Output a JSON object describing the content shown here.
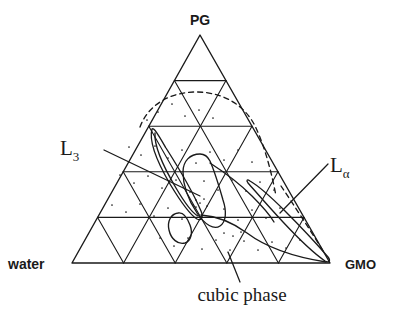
{
  "figure": {
    "type": "ternary-phase-diagram",
    "background": "#ffffff",
    "line_color": "#1a1a1a",
    "corner_labels": {
      "top": "PG",
      "bottom_left": "water",
      "bottom_right": "GMO"
    },
    "region_labels": {
      "l3": "L",
      "l3_sub": "3",
      "lalpha": "L",
      "lalpha_sub": "α",
      "cubic": "cubic phase"
    }
  },
  "chart_data": {
    "type": "scatter",
    "title": "",
    "xlabel": "",
    "ylabel": "",
    "diagram": "ternary",
    "components": [
      "water",
      "PG",
      "GMO"
    ],
    "axis_divisions": 5,
    "grid": true,
    "legend": "none",
    "vertices": {
      "top": [
        200,
        35
      ],
      "bottom_left": [
        72,
        263
      ],
      "bottom_right": [
        330,
        263
      ]
    },
    "annotations": [
      {
        "text": "PG",
        "x": 200,
        "y": 20,
        "anchor": "middle",
        "font": "sans"
      },
      {
        "text": "water",
        "x": 8,
        "y": 265,
        "anchor": "start",
        "font": "sans"
      },
      {
        "text": "GMO",
        "x": 346,
        "y": 265,
        "anchor": "start",
        "font": "sans"
      },
      {
        "text": "L3",
        "x": 62,
        "y": 150,
        "anchor": "start",
        "font": "serif"
      },
      {
        "text": "Lalpha",
        "x": 330,
        "y": 168,
        "anchor": "start",
        "font": "serif"
      },
      {
        "text": "cubic phase",
        "x": 242,
        "y": 296,
        "anchor": "middle",
        "font": "serif"
      }
    ],
    "leader_lines": [
      {
        "name": "l3-leader",
        "from": [
          104,
          150
        ],
        "to": [
          200,
          196
        ]
      },
      {
        "name": "lalpha-leader",
        "from": [
          328,
          164
        ],
        "to": [
          280,
          213
        ]
      },
      {
        "name": "cubic-leader",
        "from": [
          240,
          282
        ],
        "to": [
          228,
          252
        ]
      }
    ],
    "regions": [
      {
        "name": "L3",
        "style": "solid",
        "description": "narrow elongated sliver from upper-left to lower-right mid-triangle",
        "path": "M152,129 C149,140 156,160 170,184 C182,204 192,216 197,219 C201,221 204,218 201,211 C195,197 180,170 166,148 C159,136 154,127 152,129 Z"
      },
      {
        "name": "L3-inner",
        "style": "solid",
        "description": "inner thin line of the L3 sliver",
        "path": "M155,133 C154,146 163,166 176,188 C186,205 194,214 198,216"
      },
      {
        "name": "cubic phase",
        "style": "solid",
        "description": "closed lobe in lower-central region",
        "path": "M200,154 C190,154 183,161 183,172 C183,186 189,201 197,213 C205,225 214,230 220,226 C226,222 227,212 223,200 C219,186 214,170 210,161 C207,155 204,154 200,154 Z"
      },
      {
        "name": "cubic phase lower lobe",
        "style": "solid",
        "description": "small lobe just below centre touching base grid",
        "path": "M178,213 C171,214 167,221 169,230 C171,239 178,245 185,243 C191,241 193,233 190,225 C187,217 183,212 178,213 Z"
      },
      {
        "name": "L-alpha",
        "style": "solid",
        "description": "narrow sliver along the GMO (right) edge",
        "path": "M248,183 C256,192 268,206 283,222 C297,237 312,252 325,261 C329,263 331,261 328,257 C316,243 300,226 285,211 C270,196 257,185 250,181 C247,179 246,180 248,183 Z"
      },
      {
        "name": "tie-boundary",
        "style": "solid",
        "description": "curve sweeping from centre-left down to GMO corner",
        "path": "M201,215 C215,216 232,222 247,233 C263,245 288,256 326,262"
      },
      {
        "name": "upper-right boundary",
        "style": "solid",
        "description": "curve from cubic lobe top running right and down",
        "path": "M210,163 C224,172 240,184 252,196 C262,206 270,215 274,222"
      },
      {
        "name": "dashed arc",
        "style": "dashed",
        "description": "dashed boundary arcing over the upper-middle of the triangle",
        "path": "M140,127 C148,105 170,92 196,92 C224,92 246,106 256,128 C266,150 272,175 276,196"
      },
      {
        "name": "dashed right edge line",
        "style": "dashed",
        "description": "short dashed line near the GMO corner parallel to right edge",
        "path": "M281,186 C293,204 309,228 325,254"
      }
    ],
    "dots": [
      [
        147,
        120
      ],
      [
        158,
        112
      ],
      [
        172,
        104
      ],
      [
        185,
        116
      ],
      [
        199,
        110
      ],
      [
        213,
        118
      ],
      [
        129,
        147
      ],
      [
        141,
        155
      ],
      [
        155,
        146
      ],
      [
        168,
        158
      ],
      [
        182,
        150
      ],
      [
        196,
        163
      ],
      [
        210,
        152
      ],
      [
        224,
        160
      ],
      [
        238,
        150
      ],
      [
        252,
        162
      ],
      [
        120,
        175
      ],
      [
        134,
        183
      ],
      [
        148,
        176
      ],
      [
        162,
        188
      ],
      [
        176,
        180
      ],
      [
        190,
        192
      ],
      [
        204,
        181
      ],
      [
        218,
        190
      ],
      [
        232,
        180
      ],
      [
        246,
        191
      ],
      [
        260,
        182
      ],
      [
        274,
        190
      ],
      [
        112,
        205
      ],
      [
        126,
        212
      ],
      [
        140,
        204
      ],
      [
        154,
        216
      ],
      [
        168,
        208
      ],
      [
        182,
        219
      ],
      [
        196,
        207
      ],
      [
        210,
        217
      ],
      [
        224,
        209
      ],
      [
        238,
        220
      ],
      [
        252,
        210
      ],
      [
        266,
        218
      ],
      [
        280,
        208
      ],
      [
        160,
        238
      ],
      [
        174,
        246
      ],
      [
        188,
        238
      ],
      [
        202,
        249
      ],
      [
        216,
        240
      ],
      [
        230,
        250
      ],
      [
        244,
        241
      ],
      [
        258,
        250
      ],
      [
        272,
        242
      ],
      [
        286,
        248
      ],
      [
        300,
        240
      ],
      [
        196,
        200
      ],
      [
        200,
        203
      ],
      [
        204,
        199
      ],
      [
        193,
        205
      ],
      [
        207,
        206
      ],
      [
        224,
        233
      ],
      [
        233,
        236
      ],
      [
        241,
        232
      ]
    ]
  }
}
